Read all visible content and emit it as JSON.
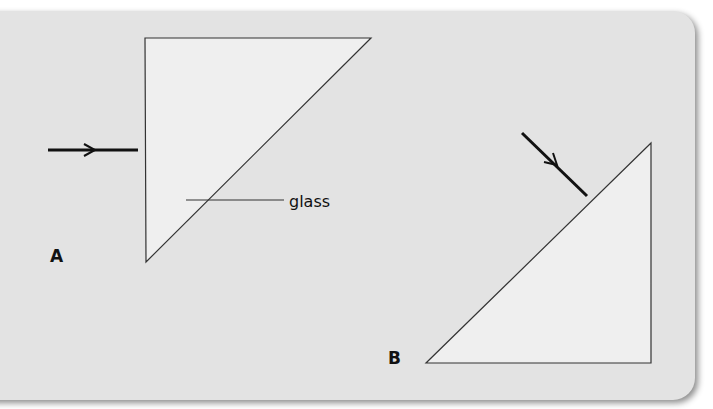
{
  "diagram": {
    "type": "optics-prism-diagram",
    "background_color": "#e3e3e3",
    "prism_fill_color": "#efefef",
    "line_color": "#333333",
    "arrow_color": "#111111",
    "figures": [
      {
        "id": "A",
        "label": "A",
        "prism": {
          "shape": "right-triangle",
          "vertices": [
            [
              145,
              38
            ],
            [
              371,
              38
            ],
            [
              146,
              262
            ]
          ]
        },
        "incident_ray": {
          "from": [
            48,
            150
          ],
          "to": [
            138,
            150
          ],
          "direction": "right"
        },
        "annotation": {
          "text": "glass",
          "leader_from": [
            186,
            200
          ],
          "leader_to": [
            284,
            200
          ]
        }
      },
      {
        "id": "B",
        "label": "B",
        "prism": {
          "shape": "right-triangle",
          "vertices": [
            [
              651,
              143
            ],
            [
              426,
              363
            ],
            [
              651,
              363
            ]
          ]
        },
        "incident_ray": {
          "from": [
            522,
            133
          ],
          "to": [
            587,
            196
          ],
          "direction": "down-right"
        }
      }
    ]
  }
}
